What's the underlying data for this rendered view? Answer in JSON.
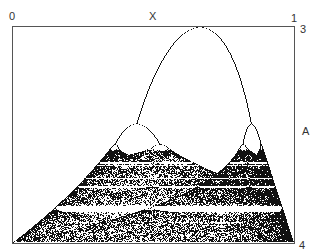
{
  "chart_data": {
    "type": "scatter",
    "title": "",
    "xlabel": "X",
    "ylabel": "A",
    "x_range": [
      0,
      1
    ],
    "y_range": [
      3,
      4
    ],
    "y_direction": "downward (A=3 at top, A=4 at bottom)",
    "x_tick_labels": [
      "0",
      "1"
    ],
    "y_tick_labels": [
      "3",
      "4"
    ],
    "grid": false,
    "legend": null,
    "features": {
      "period_2_at_top": "A = 3.0, two branches split near x ≈ 0.66",
      "period_4_split": "A ≈ 3.449",
      "period_8_split": "A ≈ 3.544",
      "onset_of_chaos": "A ≈ 3.57",
      "period_3_window": "A ≈ 3.83 (white horizontal band)",
      "full_chaos": "A = 4, x spans 0 to 1"
    },
    "point_color": "#111111"
  },
  "axes": {
    "x_label": "X",
    "y_label": "A",
    "x_min_label": "0",
    "x_max_label": "1",
    "y_min_label": "3",
    "y_max_label": "4"
  }
}
